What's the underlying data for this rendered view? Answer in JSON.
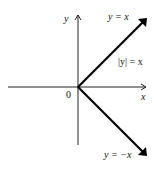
{
  "diagram": {
    "y_axis_label": "y",
    "x_axis_label": "x",
    "origin_label": "0",
    "upper_ray_label": "y = x",
    "region_label": "|y| = x",
    "lower_ray_label": "y = −x"
  }
}
